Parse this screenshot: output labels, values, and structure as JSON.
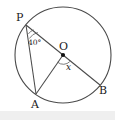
{
  "figure": {
    "background_color": "#ffffff",
    "stroke_color": "#4a4a4a",
    "label_color": "#1a1a1a",
    "points": {
      "P": {
        "label": "P",
        "x": 26,
        "y": 25,
        "label_x": 16,
        "label_y": 21
      },
      "O": {
        "label": "O",
        "x": 63,
        "y": 55,
        "label_x": 59,
        "label_y": 50
      },
      "A": {
        "label": "A",
        "x": 36,
        "y": 94,
        "label_x": 31,
        "label_y": 108
      },
      "B": {
        "label": "B",
        "x": 100,
        "y": 85,
        "label_x": 99,
        "label_y": 94
      }
    },
    "circle": {
      "cx": 63,
      "cy": 55,
      "r": 48
    },
    "angles": {
      "at_P": {
        "label": "40°",
        "value": 40,
        "unit": "degrees",
        "label_x": 28,
        "label_y": 45
      },
      "at_O": {
        "label": "x",
        "value": null,
        "unit": "degrees",
        "label_x": 66,
        "label_y": 70
      }
    },
    "segments": [
      {
        "name": "PB",
        "from": "P",
        "to": "B",
        "kind": "diameter"
      },
      {
        "name": "PA",
        "from": "P",
        "to": "A",
        "kind": "chord"
      },
      {
        "name": "AO",
        "from": "A",
        "to": "O",
        "kind": "radius"
      }
    ]
  }
}
